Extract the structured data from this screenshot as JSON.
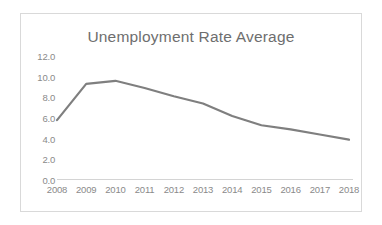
{
  "chart_data": {
    "type": "line",
    "title": "Unemployment Rate Average",
    "xlabel": "",
    "ylabel": "",
    "categories": [
      "2008",
      "2009",
      "2010",
      "2011",
      "2012",
      "2013",
      "2014",
      "2015",
      "2016",
      "2017",
      "2018"
    ],
    "series": [
      {
        "name": "Unemployment Rate Average",
        "values": [
          5.8,
          9.3,
          9.6,
          8.9,
          8.1,
          7.4,
          6.2,
          5.3,
          4.9,
          4.4,
          3.9
        ]
      }
    ],
    "ylim": [
      0.0,
      12.0
    ],
    "ytick_labels": [
      "12.0",
      "10.0",
      "8.0",
      "6.0",
      "4.0",
      "2.0",
      "0.0"
    ],
    "ytick_values": [
      12.0,
      10.0,
      8.0,
      6.0,
      4.0,
      2.0,
      0.0
    ],
    "grid": false,
    "legend": "none",
    "line_color": "#7f7f7f",
    "axis_color": "#d4d4d4",
    "text_color": "#8a8a8a",
    "title_color": "#6e6e6e",
    "border_color": "#d9d9d9",
    "background_color": "#ffffff"
  }
}
